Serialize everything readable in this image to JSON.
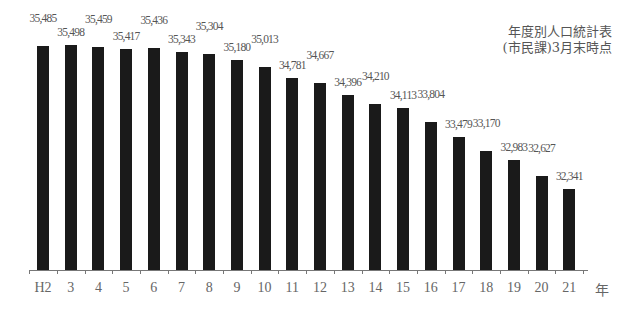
{
  "chart_data": {
    "type": "bar",
    "title": "年度別人口統計表",
    "subtitle": "(市民課)3月末時点",
    "xlabel": "年",
    "ylabel": "",
    "categories": [
      "H2",
      "3",
      "4",
      "5",
      "6",
      "7",
      "8",
      "9",
      "10",
      "11",
      "12",
      "13",
      "14",
      "15",
      "16",
      "17",
      "18",
      "19",
      "20",
      "21"
    ],
    "values": [
      35485,
      35498,
      35459,
      35417,
      35436,
      35343,
      35304,
      35180,
      35013,
      34781,
      34667,
      34396,
      34210,
      34113,
      33804,
      33479,
      33170,
      32983,
      32627,
      32341
    ],
    "value_labels": [
      "35,485",
      "35,498",
      "35,459",
      "35,417",
      "35,436",
      "35,343",
      "35,304",
      "35,180",
      "35,013",
      "34,781",
      "34,667",
      "34,396",
      "34,210",
      "34,113",
      "33,804",
      "33,479",
      "33,170",
      "32,983",
      "32,627",
      "32,341"
    ],
    "ylim": [
      29800,
      35600
    ],
    "grid": false,
    "legend": "none",
    "bar_color": "#1a1a1a"
  },
  "note": {
    "line1": "年度別人口統計表",
    "line2": "(市民課)3月末時点"
  },
  "axis": {
    "unit_label": "年"
  }
}
